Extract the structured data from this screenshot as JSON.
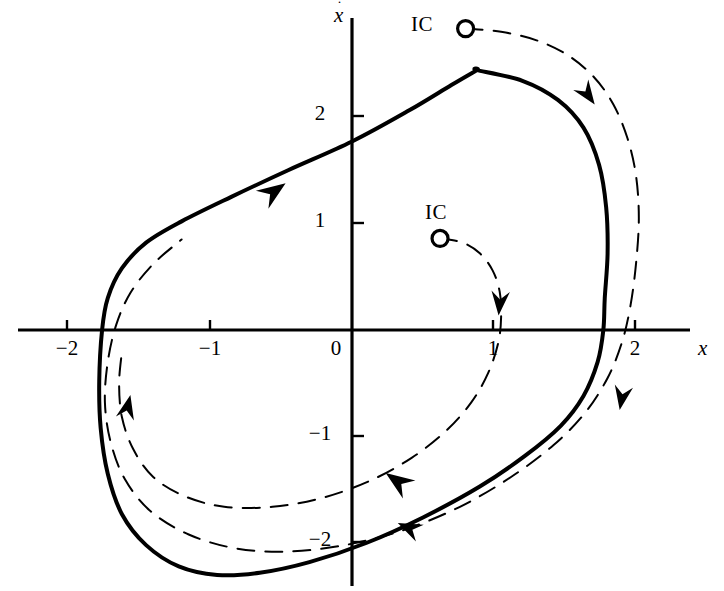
{
  "figure": {
    "background": "#ffffff",
    "ink_color": "#000000"
  },
  "axes": {
    "x_axis_label": "x",
    "y_axis_label": "x",
    "y_axis_label_dot": "˙",
    "origin_label": "0",
    "x_ticks": [
      {
        "value": -2,
        "label": "−2",
        "px": 67
      },
      {
        "value": -1,
        "label": "−1",
        "px": 210
      },
      {
        "value": 0,
        "label": "0",
        "px": 352
      },
      {
        "value": 1,
        "label": "1",
        "px": 493
      },
      {
        "value": 2,
        "label": "2",
        "px": 635
      }
    ],
    "y_ticks": [
      {
        "value": 2,
        "label": "2",
        "px": 116
      },
      {
        "value": 1,
        "label": "1",
        "px": 223
      },
      {
        "value": -1,
        "label": "−1",
        "px": 436
      },
      {
        "value": -2,
        "label": "−2",
        "px": 542
      }
    ],
    "x_range": [
      -2.35,
      2.38
    ],
    "y_range": [
      -2.55,
      2.93
    ],
    "origin_px": {
      "x": 352,
      "y": 330
    },
    "scale_px_per_unit": {
      "x": 142,
      "y": 106.5
    }
  },
  "annotations": {
    "ic_outer": {
      "label": "IC",
      "x": 0.8,
      "y": 2.83
    },
    "ic_inner": {
      "label": "IC",
      "x": 0.62,
      "y": 0.86
    }
  },
  "chart_data": {
    "type": "line",
    "xlabel": "x",
    "ylabel": "xdot",
    "xlim": [
      -2.35,
      2.38
    ],
    "ylim": [
      -2.55,
      2.93
    ],
    "grid": false,
    "legend": null,
    "series": [
      {
        "name": "limit-cycle",
        "style": "solid",
        "linewidth": 4,
        "closed": true,
        "direction": "clockwise",
        "x_axis_crossings": [
          -1.76,
          1.77
        ],
        "extrema": {
          "top": [
            0.88,
            2.44
          ],
          "bottom": [
            -0.95,
            -2.3
          ]
        },
        "points": [
          [
            0.88,
            2.44
          ],
          [
            1.2,
            2.34
          ],
          [
            1.45,
            2.16
          ],
          [
            1.63,
            1.9
          ],
          [
            1.74,
            1.55
          ],
          [
            1.79,
            1.15
          ],
          [
            1.8,
            0.72
          ],
          [
            1.78,
            0.3
          ],
          [
            1.77,
            0.0
          ],
          [
            1.73,
            -0.3
          ],
          [
            1.63,
            -0.62
          ],
          [
            1.47,
            -0.9
          ],
          [
            1.22,
            -1.18
          ],
          [
            0.9,
            -1.47
          ],
          [
            0.5,
            -1.76
          ],
          [
            0.1,
            -2.0
          ],
          [
            -0.3,
            -2.18
          ],
          [
            -0.65,
            -2.28
          ],
          [
            -0.95,
            -2.3
          ],
          [
            -1.22,
            -2.22
          ],
          [
            -1.45,
            -2.02
          ],
          [
            -1.62,
            -1.73
          ],
          [
            -1.72,
            -1.35
          ],
          [
            -1.77,
            -0.92
          ],
          [
            -1.78,
            -0.48
          ],
          [
            -1.76,
            0.0
          ],
          [
            -1.72,
            0.3
          ],
          [
            -1.62,
            0.58
          ],
          [
            -1.45,
            0.82
          ],
          [
            -1.2,
            1.02
          ],
          [
            -0.85,
            1.25
          ],
          [
            -0.45,
            1.5
          ],
          [
            0.0,
            1.77
          ],
          [
            0.4,
            2.06
          ],
          [
            0.7,
            2.3
          ],
          [
            0.88,
            2.44
          ]
        ]
      },
      {
        "name": "outer-transient-from-IC",
        "style": "dashed",
        "linewidth": 2,
        "closed": false,
        "direction": "clockwise",
        "start": [
          0.8,
          2.83
        ],
        "points": [
          [
            0.8,
            2.83
          ],
          [
            1.05,
            2.8
          ],
          [
            1.3,
            2.72
          ],
          [
            1.52,
            2.58
          ],
          [
            1.7,
            2.38
          ],
          [
            1.84,
            2.12
          ],
          [
            1.94,
            1.8
          ],
          [
            2.0,
            1.45
          ],
          [
            2.02,
            1.05
          ],
          [
            2.0,
            0.62
          ],
          [
            1.96,
            0.22
          ],
          [
            1.9,
            -0.12
          ],
          [
            1.8,
            -0.45
          ],
          [
            1.64,
            -0.78
          ],
          [
            1.42,
            -1.08
          ],
          [
            1.12,
            -1.38
          ],
          [
            0.76,
            -1.66
          ],
          [
            0.36,
            -1.88
          ],
          [
            -0.05,
            -2.02
          ],
          [
            -0.45,
            -2.08
          ],
          [
            -0.82,
            -2.05
          ],
          [
            -1.15,
            -1.92
          ],
          [
            -1.42,
            -1.7
          ],
          [
            -1.6,
            -1.4
          ],
          [
            -1.7,
            -1.05
          ],
          [
            -1.74,
            -0.68
          ],
          [
            -1.72,
            -0.3
          ],
          [
            -1.66,
            0.05
          ],
          [
            -1.56,
            0.35
          ],
          [
            -1.4,
            0.62
          ],
          [
            -1.2,
            0.85
          ]
        ],
        "arrows": [
          {
            "x": 1.66,
            "y": 2.21,
            "angle": 55
          },
          {
            "x": 1.9,
            "y": -0.64,
            "angle": 100
          },
          {
            "x": 0.4,
            "y": -1.86,
            "angle": 205
          },
          {
            "x": -1.58,
            "y": -0.72,
            "angle": 283
          }
        ]
      },
      {
        "name": "inner-transient-from-IC",
        "style": "dashed",
        "linewidth": 2,
        "closed": false,
        "direction": "clockwise",
        "start": [
          0.62,
          0.86
        ],
        "points": [
          [
            0.62,
            0.86
          ],
          [
            0.78,
            0.82
          ],
          [
            0.9,
            0.72
          ],
          [
            0.99,
            0.56
          ],
          [
            1.04,
            0.36
          ],
          [
            1.05,
            0.12
          ],
          [
            1.03,
            -0.12
          ],
          [
            0.96,
            -0.4
          ],
          [
            0.84,
            -0.68
          ],
          [
            0.66,
            -0.95
          ],
          [
            0.42,
            -1.2
          ],
          [
            0.12,
            -1.42
          ],
          [
            -0.22,
            -1.58
          ],
          [
            -0.56,
            -1.66
          ],
          [
            -0.9,
            -1.66
          ],
          [
            -1.18,
            -1.56
          ],
          [
            -1.4,
            -1.38
          ],
          [
            -1.54,
            -1.12
          ],
          [
            -1.62,
            -0.82
          ],
          [
            -1.64,
            -0.5
          ],
          [
            -1.62,
            -0.2
          ]
        ],
        "arrows": [
          {
            "x": 1.04,
            "y": 0.25,
            "angle": 95
          }
        ]
      }
    ],
    "limit_cycle_arrows": [
      {
        "x": -0.55,
        "y": 1.3,
        "angle": -35
      },
      {
        "x": 0.32,
        "y": -1.42,
        "angle": 215
      }
    ]
  }
}
